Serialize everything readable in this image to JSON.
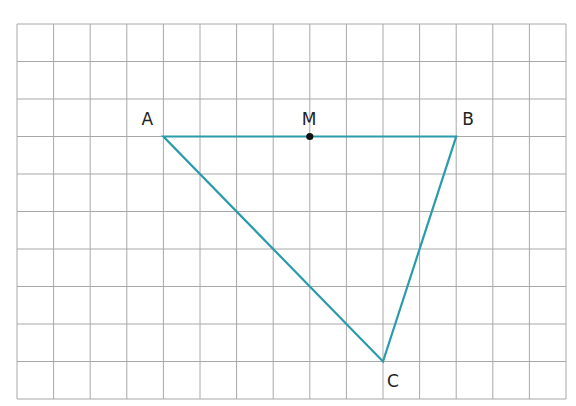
{
  "grid": {
    "columns": 15,
    "rows": 10,
    "origin_x": 17,
    "origin_y": 24,
    "cell_width": 36.6,
    "cell_height": 37.5,
    "line_color": "#a8a8a8"
  },
  "triangle": {
    "stroke_color": "#2a9bab",
    "points": {
      "A": {
        "label": "A",
        "col": 4,
        "row": 3
      },
      "B": {
        "label": "B",
        "col": 12,
        "row": 3
      },
      "C": {
        "label": "C",
        "col": 10,
        "row": 9
      }
    }
  },
  "midpoint": {
    "label": "M",
    "col": 8,
    "row": 3,
    "color": "#111111"
  }
}
